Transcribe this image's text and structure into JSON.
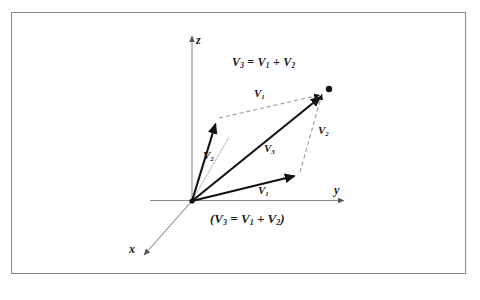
{
  "figure": {
    "title_equation": {
      "parts": [
        "V",
        "3",
        " = ",
        "V",
        "1",
        " + ",
        "V",
        "2"
      ],
      "text": "V3 = V1 + V2"
    },
    "caption_equation": {
      "text": "(V3 = V1 + V2)"
    },
    "axes": [
      {
        "name": "z-axis",
        "label": "z",
        "direction": "up"
      },
      {
        "name": "y-axis",
        "label": "y",
        "direction": "right"
      },
      {
        "name": "x-axis",
        "label": "x",
        "direction": "down-left"
      }
    ],
    "vector_labels": {
      "v2_solid": "V",
      "v2_solid_sub": "2",
      "v3_solid": "V",
      "v3_solid_sub": "3",
      "v1_solid": "V",
      "v1_solid_sub": "1",
      "v1_dashed": "V",
      "v1_dashed_sub": "1",
      "v2_dashed": "V",
      "v2_dashed_sub": "2"
    },
    "colors": {
      "frame_border": "#8b8b8b",
      "axis_line": "#8a8a8a",
      "vector_solid": "#111111",
      "vector_dashed": "#999999",
      "label_text": "#1a1a1a",
      "background": "#ffffff"
    },
    "geometry": {
      "origin": [
        192,
        201
      ],
      "z_tip": [
        192,
        33
      ],
      "y_tip": [
        348,
        200
      ],
      "x_tip": [
        140,
        258
      ],
      "v2_head": [
        217,
        120
      ],
      "v1_head": [
        298,
        174
      ],
      "v3_head": [
        324,
        93
      ],
      "resultant_dot": [
        329,
        89
      ]
    }
  }
}
